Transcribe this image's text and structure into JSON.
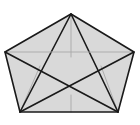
{
  "figure": {
    "shape_type": "polygon",
    "sides": 5,
    "background_color": "#ffffff",
    "fill_color": "#d9d9d9",
    "outline_color": "#1a1a1a",
    "diagonal_color": "#1a1a1a",
    "faint_line_color": "#a8a8a8",
    "outline_width": "1.6",
    "diagonal_width": "1.6",
    "faint_line_width": "0.9",
    "canvas": {
      "width": 140,
      "height": 125
    },
    "vertices": [
      {
        "name": "top",
        "label": "A",
        "x": 71,
        "y": 14
      },
      {
        "name": "right",
        "label": "B",
        "x": 134,
        "y": 52
      },
      {
        "name": "bottom-right",
        "label": "C",
        "x": 118,
        "y": 112
      },
      {
        "name": "bottom-left",
        "label": "D",
        "x": 20,
        "y": 112
      },
      {
        "name": "left",
        "label": "E",
        "x": 5,
        "y": 52
      }
    ],
    "outline_path": "M 71 14 L 134 52 L 118 112 L 20 112 L 5 52 Z",
    "diagonals": [
      {
        "name": "top-to-bottom-left",
        "from": "top",
        "to": "bottom-left",
        "path": "M 71 14 L 20 112"
      },
      {
        "name": "top-to-bottom-right",
        "from": "top",
        "to": "bottom-right",
        "path": "M 71 14 L 118 112"
      },
      {
        "name": "left-to-right",
        "from": "left",
        "to": "right",
        "path": "M 5 52 L 134 52"
      },
      {
        "name": "left-to-bottom-right",
        "from": "left",
        "to": "bottom-right",
        "path": "M 5 52 L 118 112"
      },
      {
        "name": "right-to-bottom-left",
        "from": "right",
        "to": "bottom-left",
        "path": "M 134 52 L 20 112"
      }
    ],
    "faint_lines": [
      {
        "name": "top-vertical-median",
        "path": "M 71 14 L 71 57"
      },
      {
        "name": "bottom-vertical-median",
        "path": "M 71 95 L 71 112"
      },
      {
        "name": "left-inner-spoke",
        "path": "M 20 112 L 40 66"
      },
      {
        "name": "right-inner-spoke",
        "path": "M 118 112 L 101 66"
      }
    ],
    "intersections": [
      {
        "name": "center-lower-node",
        "x": 71,
        "y": 95
      },
      {
        "name": "left-upper-node",
        "x": 40,
        "y": 66
      },
      {
        "name": "right-upper-node",
        "x": 101,
        "y": 66
      }
    ]
  }
}
